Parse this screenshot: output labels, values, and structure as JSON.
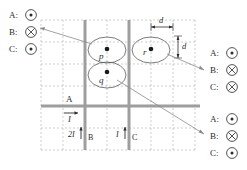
{
  "figure": {
    "type": "physics-diagram",
    "grid": {
      "cols": 8,
      "rows": 6,
      "cell_px": 22,
      "style": "dashed",
      "color": "#b9b9b9"
    },
    "wires": [
      {
        "name": "A",
        "label": "A",
        "orientation": "horizontal",
        "current_label": "I",
        "arrow": "right",
        "color": "#9e9e9e"
      },
      {
        "name": "B",
        "label": "B",
        "orientation": "vertical",
        "current_label": "2I",
        "arrow": "up",
        "color": "#9e9e9e"
      },
      {
        "name": "C",
        "label": "C",
        "orientation": "vertical",
        "current_label": "I",
        "arrow": "up",
        "color": "#9e9e9e"
      }
    ],
    "points": [
      {
        "id": "p",
        "label": "p"
      },
      {
        "id": "q",
        "label": "q"
      },
      {
        "id": "r",
        "label": "r"
      }
    ],
    "dimensions": [
      {
        "id": "d-horizontal",
        "label": "d",
        "orientation": "horizontal"
      },
      {
        "id": "d-vertical",
        "label": "d",
        "orientation": "vertical"
      }
    ],
    "legends": [
      {
        "id": "legend-top-left",
        "position": "top-left",
        "rows": [
          {
            "label": "A:",
            "symbol": "dot",
            "glyph": "out-of-page"
          },
          {
            "label": "B:",
            "symbol": "cross",
            "glyph": "into-page"
          },
          {
            "label": "C:",
            "symbol": "dot",
            "glyph": "out-of-page"
          }
        ]
      },
      {
        "id": "legend-right-upper",
        "position": "right-upper",
        "rows": [
          {
            "label": "A:",
            "symbol": "dot",
            "glyph": "out-of-page"
          },
          {
            "label": "B:",
            "symbol": "cross",
            "glyph": "into-page"
          },
          {
            "label": "C:",
            "symbol": "cross",
            "glyph": "into-page"
          }
        ]
      },
      {
        "id": "legend-right-lower",
        "position": "right-lower",
        "rows": [
          {
            "label": "A:",
            "symbol": "dot",
            "glyph": "out-of-page"
          },
          {
            "label": "B:",
            "symbol": "cross",
            "glyph": "into-page"
          },
          {
            "label": "C:",
            "symbol": "dot",
            "glyph": "out-of-page"
          }
        ]
      }
    ],
    "leader_lines": [
      {
        "from": "p",
        "to": "legend-top-left"
      },
      {
        "from": "r",
        "to": "legend-right-upper"
      },
      {
        "from": "q",
        "to": "legend-right-lower"
      }
    ],
    "colors": {
      "ink": "#2b2b2b",
      "wire": "#9e9e9e",
      "grid": "#b9b9b9",
      "leader": "#8a8a8a",
      "background": "#ffffff"
    }
  }
}
